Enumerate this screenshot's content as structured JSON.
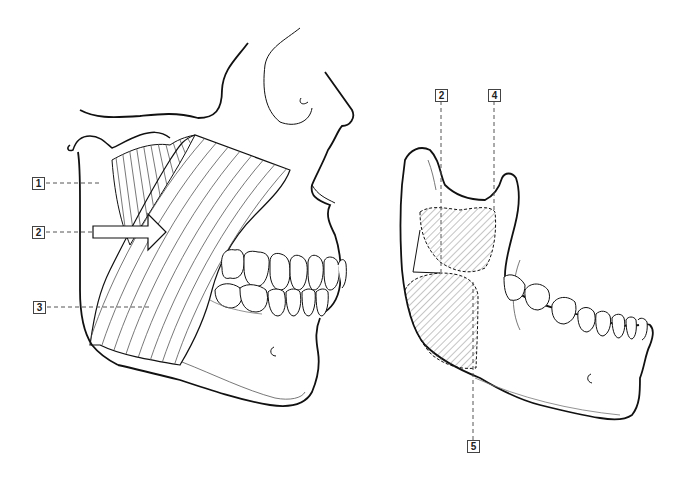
{
  "figure": {
    "left_panel": {
      "view": "lateral view of skull with jaw closed",
      "labels": [
        {
          "id": "label-1",
          "text": "1",
          "x": 32,
          "y": 177
        },
        {
          "id": "label-2",
          "text": "2",
          "x": 32,
          "y": 226
        },
        {
          "id": "label-3",
          "text": "3",
          "x": 33,
          "y": 302
        }
      ]
    },
    "right_panel": {
      "view": "lateral view of isolated mandible",
      "labels": [
        {
          "id": "label-2r",
          "text": "2",
          "x": 435,
          "y": 89
        },
        {
          "id": "label-4",
          "text": "4",
          "x": 488,
          "y": 89
        },
        {
          "id": "label-5",
          "text": "5",
          "x": 467,
          "y": 440
        }
      ]
    },
    "colors": {
      "outline": "#111111",
      "hatch": "#555555",
      "leader": "#555555",
      "background": "#ffffff"
    }
  }
}
